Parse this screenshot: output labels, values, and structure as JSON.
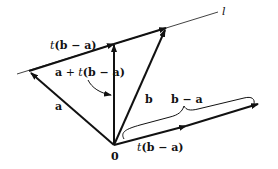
{
  "diagram": {
    "colors": {
      "stroke": "#111111",
      "background": "#ffffff"
    },
    "points": {
      "origin": {
        "x": 114,
        "y": 145,
        "label": "0"
      },
      "a": {
        "x": 29,
        "y": 71
      },
      "on_line": {
        "x": 114,
        "y": 42
      },
      "b": {
        "x": 166,
        "y": 27
      },
      "b_minus_a": {
        "x": 258,
        "y": 104
      },
      "t_b_minus_a": {
        "x": 186,
        "y": 126
      }
    },
    "line_l": {
      "x1": 17,
      "y1": 74,
      "x2": 218,
      "y2": 12,
      "label": "l"
    },
    "labels": {
      "t_ba_top": {
        "prefix": "t",
        "body": "(b − a)"
      },
      "a_plus_t": {
        "a": "a",
        "plus": " + ",
        "t": "t",
        "rest": "(b − a)"
      },
      "a": "a",
      "b": "b",
      "b_minus_a": "b − a",
      "zero": "0",
      "t_ba_bottom": {
        "prefix": "t",
        "body": "(b − a)"
      },
      "l": "l"
    }
  }
}
